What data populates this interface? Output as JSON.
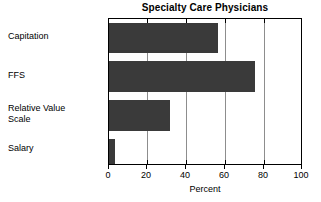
{
  "chart_data": {
    "type": "bar",
    "orientation": "horizontal",
    "title": "Specialty Care Physicians",
    "xlabel": "Percent",
    "ylabel": "",
    "categories": [
      "Capitation",
      "FFS",
      "Relative Value\nScale",
      "Salary"
    ],
    "values": [
      57,
      76,
      32,
      3
    ],
    "xlim": [
      0,
      100
    ],
    "xticks": [
      0,
      20,
      40,
      60,
      80,
      100
    ],
    "xtick_labels": [
      "0",
      "20",
      "40",
      "60",
      "80",
      "100"
    ],
    "grid": true,
    "legend": false,
    "bar_color": "#3a3a3a",
    "gridline_color": "#8d8d8d",
    "axis_color": "#000000"
  }
}
